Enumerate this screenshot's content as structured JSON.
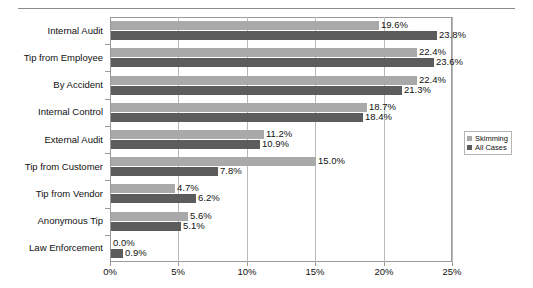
{
  "chart_data": {
    "type": "bar",
    "orientation": "horizontal",
    "title": "",
    "xlabel": "",
    "ylabel": "",
    "xlim": [
      0,
      25
    ],
    "xticks": [
      "0%",
      "5%",
      "10%",
      "15%",
      "20%",
      "25%"
    ],
    "xtick_values": [
      0,
      5,
      10,
      15,
      20,
      25
    ],
    "grid": true,
    "legend_position": "right",
    "categories": [
      "Internal Audit",
      "Tip from Employee",
      "By Accident",
      "Internal Control",
      "External Audit",
      "Tip from Customer",
      "Tip from Vendor",
      "Anonymous Tip",
      "Law Enforcement"
    ],
    "series": [
      {
        "name": "Skimming",
        "color": "#a9a9a9",
        "values": [
          19.6,
          22.4,
          22.4,
          18.7,
          11.2,
          15.0,
          4.7,
          5.6,
          0.0
        ],
        "labels": [
          "19.6%",
          "22.4%",
          "22.4%",
          "18.7%",
          "11.2%",
          "15.0%",
          "4.7%",
          "5.6%",
          "0.0%"
        ]
      },
      {
        "name": "All Cases",
        "color": "#5c5c5c",
        "values": [
          23.8,
          23.6,
          21.3,
          18.4,
          10.9,
          7.8,
          6.2,
          5.1,
          0.9
        ],
        "labels": [
          "23.8%",
          "23.6%",
          "21.3%",
          "18.4%",
          "10.9%",
          "7.8%",
          "6.2%",
          "5.1%",
          "0.9%"
        ]
      }
    ]
  },
  "legend": {
    "items": [
      {
        "label": "Skimming",
        "color": "#a9a9a9"
      },
      {
        "label": "All Cases",
        "color": "#5c5c5c"
      }
    ]
  }
}
